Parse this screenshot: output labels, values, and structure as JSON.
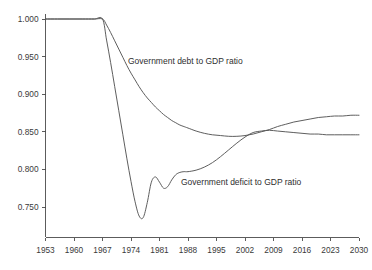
{
  "chart_data": {
    "type": "line",
    "title": "",
    "subtitle": "",
    "xlabel": "",
    "ylabel": "",
    "grid": false,
    "legend_position": "inline-annotation",
    "xlim": [
      1953,
      2030
    ],
    "ylim": [
      0.735,
      1.01
    ],
    "x_ticks": [
      1953,
      1960,
      1967,
      1974,
      1981,
      1988,
      1995,
      2002,
      2009,
      2016,
      2023,
      2030
    ],
    "x_tick_labels": [
      "1953",
      "1960",
      "1967",
      "1974",
      "1981",
      "1988",
      "1995",
      "2002",
      "2009",
      "2016",
      "2023",
      "2030"
    ],
    "y_ticks": [
      0.75,
      0.8,
      0.85,
      0.9,
      0.95,
      1.0
    ],
    "y_tick_labels": [
      "0.750",
      "0.800",
      "0.850",
      "0.900",
      "0.950",
      "1.000"
    ],
    "annotations": [
      {
        "text": "Government debt to GDP ratio",
        "x_px": 128,
        "y_px": 64
      },
      {
        "text": "Government deficit to GDP ratio",
        "x_px": 181,
        "y_px": 185
      }
    ],
    "series": [
      {
        "name": "Government debt to GDP ratio",
        "color": "#555555",
        "x": [
          1953,
          1956,
          1959,
          1962,
          1965,
          1967,
          1968,
          1969,
          1970,
          1971,
          1972,
          1973,
          1974,
          1975,
          1976,
          1977,
          1978,
          1979,
          1980,
          1981,
          1982,
          1983,
          1984,
          1985,
          1986,
          1987,
          1988,
          1990,
          1992,
          1994,
          1996,
          1998,
          2000,
          2002,
          2004,
          2006,
          2008,
          2010,
          2012,
          2014,
          2016,
          2018,
          2020,
          2022,
          2024,
          2026,
          2028,
          2030
        ],
        "values": [
          1.0,
          1.0,
          1.0,
          1.0,
          1.0,
          1.0,
          0.992,
          0.982,
          0.971,
          0.96,
          0.949,
          0.938,
          0.928,
          0.919,
          0.91,
          0.902,
          0.895,
          0.889,
          0.883,
          0.878,
          0.873,
          0.869,
          0.865,
          0.862,
          0.859,
          0.857,
          0.855,
          0.851,
          0.848,
          0.846,
          0.845,
          0.844,
          0.844,
          0.845,
          0.847,
          0.85,
          0.853,
          0.857,
          0.86,
          0.863,
          0.865,
          0.867,
          0.869,
          0.87,
          0.871,
          0.871,
          0.872,
          0.872
        ]
      },
      {
        "name": "Government deficit to GDP ratio",
        "color": "#555555",
        "x": [
          1953,
          1956,
          1959,
          1962,
          1965,
          1967,
          1968,
          1969,
          1970,
          1971,
          1972,
          1973,
          1974,
          1975,
          1976,
          1977,
          1978,
          1979,
          1980,
          1981,
          1982,
          1983,
          1984,
          1985,
          1986,
          1987,
          1988,
          1990,
          1992,
          1994,
          1996,
          1998,
          2000,
          2002,
          2004,
          2006,
          2008,
          2010,
          2012,
          2014,
          2016,
          2018,
          2020,
          2022,
          2024,
          2026,
          2028,
          2030
        ],
        "values": [
          1.0,
          1.0,
          1.0,
          1.0,
          1.0,
          1.0,
          0.972,
          0.942,
          0.91,
          0.878,
          0.846,
          0.814,
          0.784,
          0.757,
          0.738,
          0.736,
          0.756,
          0.783,
          0.79,
          0.783,
          0.775,
          0.777,
          0.786,
          0.793,
          0.796,
          0.797,
          0.797,
          0.799,
          0.803,
          0.809,
          0.817,
          0.826,
          0.835,
          0.843,
          0.849,
          0.851,
          0.852,
          0.851,
          0.85,
          0.849,
          0.848,
          0.847,
          0.847,
          0.846,
          0.846,
          0.846,
          0.846,
          0.846
        ]
      }
    ],
    "crossing_point": {
      "x": 2002,
      "y": 0.845
    }
  }
}
